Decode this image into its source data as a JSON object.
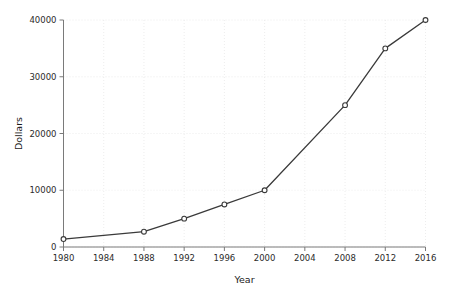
{
  "chart_data": {
    "type": "line",
    "title": "",
    "xlabel": "Year",
    "ylabel": "Dollars",
    "xlim": [
      1980,
      2016
    ],
    "ylim": [
      0,
      40000
    ],
    "grid": true,
    "legend": false,
    "legend_position": "none",
    "marker": "open-circle",
    "line_color": "#3a3a3a",
    "marker_color": "#3a3a3a",
    "grid_color": "#e8e8e8",
    "axis_color": "#7a7a7a",
    "text_color": "#2b2b2b",
    "background_color": "#ffffff",
    "xticks": [
      1980,
      1984,
      1988,
      1992,
      1996,
      2000,
      2004,
      2008,
      2012,
      2016
    ],
    "xtick_labels": [
      "1980",
      "1984",
      "1988",
      "1992",
      "1996",
      "2000",
      "2004",
      "2008",
      "2012",
      "2016"
    ],
    "yticks": [
      0,
      10000,
      20000,
      30000,
      40000
    ],
    "ytick_labels": [
      "0",
      "10000",
      "20000",
      "30000",
      "40000"
    ],
    "x": [
      1980,
      1988,
      1992,
      1996,
      2000,
      2008,
      2012,
      2016
    ],
    "values": [
      1400,
      2700,
      5000,
      7500,
      10000,
      25000,
      35000,
      40000
    ],
    "series": [
      {
        "name": "Dollars",
        "x": [
          1980,
          1988,
          1992,
          1996,
          2000,
          2008,
          2012,
          2016
        ],
        "values": [
          1400,
          2700,
          5000,
          7500,
          10000,
          25000,
          35000,
          40000
        ]
      }
    ],
    "points": [
      {
        "x": 1980,
        "y": 1400
      },
      {
        "x": 1988,
        "y": 2700
      },
      {
        "x": 1992,
        "y": 5000
      },
      {
        "x": 1996,
        "y": 7500
      },
      {
        "x": 2000,
        "y": 10000
      },
      {
        "x": 2008,
        "y": 25000
      },
      {
        "x": 2012,
        "y": 35000
      },
      {
        "x": 2016,
        "y": 40000
      }
    ],
    "annotations": []
  }
}
